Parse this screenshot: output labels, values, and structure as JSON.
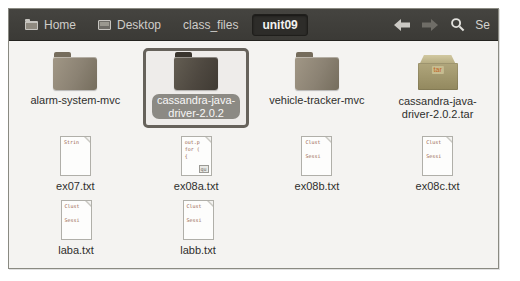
{
  "toolbar": {
    "breadcrumbs": [
      {
        "label": "Home",
        "icon": "home-folder-icon"
      },
      {
        "label": "Desktop",
        "icon": "desktop-icon"
      },
      {
        "label": "class_files"
      },
      {
        "label": "unit09",
        "active": true
      }
    ],
    "nav": {
      "back": "enabled",
      "forward": "disabled"
    },
    "search_icon": "magnifier-icon",
    "search_label": "Se"
  },
  "files": {
    "items": [
      {
        "label": "alarm-system-mvc",
        "type": "folder",
        "icon": "folder-icon"
      },
      {
        "label": "cassandra-java-\ndriver-2.0.2",
        "type": "folder",
        "icon": "folder-icon",
        "selected": true
      },
      {
        "label": "vehicle-tracker-mvc",
        "type": "folder",
        "icon": "folder-icon"
      },
      {
        "label": "cassandra-java-\ndriver-2.0.2.tar",
        "type": "archive",
        "icon": "tar-archive-icon",
        "badge": "tar"
      },
      {
        "label": "ex07.txt",
        "type": "text",
        "icon": "text-file-icon",
        "preview": "Strin"
      },
      {
        "label": "ex08a.txt",
        "type": "text",
        "icon": "text-file-icon",
        "preview": "out.p\nfor (\n{",
        "preview_badge": "qu"
      },
      {
        "label": "ex08b.txt",
        "type": "text",
        "icon": "text-file-icon",
        "preview": "Clust\n\nSessi"
      },
      {
        "label": "ex08c.txt",
        "type": "text",
        "icon": "text-file-icon",
        "preview": "Clust\n\nSessi"
      },
      {
        "label": "laba.txt",
        "type": "text",
        "icon": "text-file-icon",
        "preview": "Clust\n\nSessi"
      },
      {
        "label": "labb.txt",
        "type": "text",
        "icon": "text-file-icon",
        "preview": "Clust\n\nSessi"
      }
    ]
  },
  "colors": {
    "toolbar_bg": "#403f3a",
    "active_crumb_bg": "#2d2c29",
    "content_bg": "#f4f3f1",
    "selection_border": "#66625b",
    "selected_label_bg": "#8e8d87",
    "folder_body": "#8b8273",
    "tar_body": "#a99f75",
    "tar_text": "#c2641c",
    "preview_text": "#96604a"
  }
}
